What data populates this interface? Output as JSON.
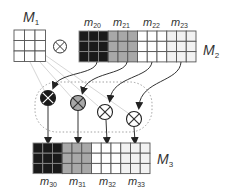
{
  "colors": {
    "black_block": "#1a1a1a",
    "gray_block": "#a8a8a8",
    "white_block": "#ffffff",
    "light_block": "#f2f2f2",
    "grid_line": "#555555",
    "arrow": "#333333",
    "faint_line": "#d0d0d0",
    "dotted": "#888888"
  },
  "labels": {
    "M1": {
      "main": "M",
      "sub": "1"
    },
    "M2": {
      "main": "M",
      "sub": "2"
    },
    "M3": {
      "main": "M",
      "sub": "3"
    },
    "operator": "⊗",
    "m2_blocks": [
      {
        "main": "m",
        "sub": "20"
      },
      {
        "main": "m",
        "sub": "21"
      },
      {
        "main": "m",
        "sub": "22"
      },
      {
        "main": "m",
        "sub": "23"
      }
    ],
    "m3_blocks": [
      {
        "main": "m",
        "sub": "30"
      },
      {
        "main": "m",
        "sub": "31"
      },
      {
        "main": "m",
        "sub": "32"
      },
      {
        "main": "m",
        "sub": "33"
      }
    ]
  },
  "nodes": [
    {
      "name": "multiply-node-1",
      "fill": "#1a1a1a",
      "cross": "#ffffff"
    },
    {
      "name": "multiply-node-2",
      "fill": "#a8a8a8",
      "cross": "#333333"
    },
    {
      "name": "multiply-node-3",
      "fill": "#ffffff",
      "cross": "#333333"
    },
    {
      "name": "multiply-node-4",
      "fill": "#ffffff",
      "cross": "#333333"
    }
  ]
}
